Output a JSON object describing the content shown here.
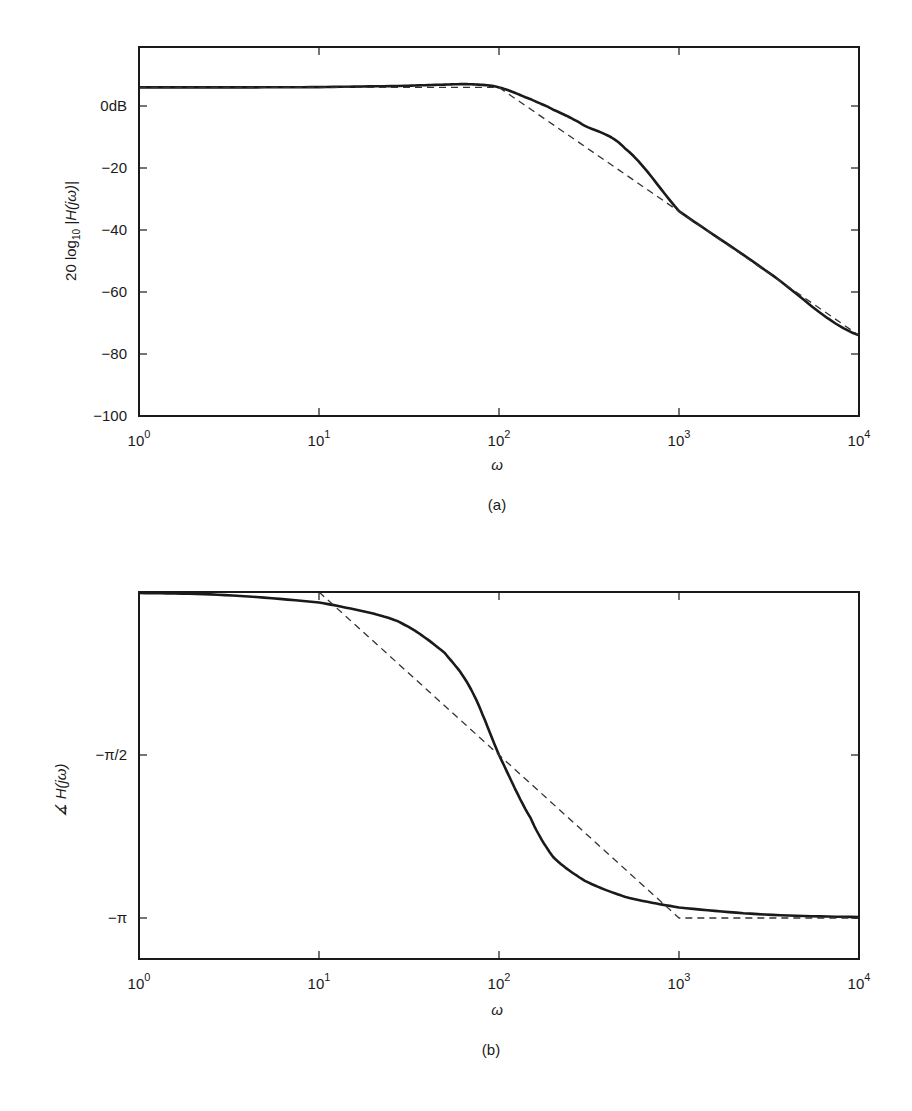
{
  "figure": {
    "panels": [
      {
        "caption": "(a)",
        "xlabel": "ω",
        "ylabel_prefix": "20 log",
        "ylabel_sub": "10",
        "ylabel_suffix": " |H(jω)|",
        "xticks": [
          {
            "base": "10",
            "exp": "0"
          },
          {
            "base": "10",
            "exp": "1"
          },
          {
            "base": "10",
            "exp": "2"
          },
          {
            "base": "10",
            "exp": "3"
          },
          {
            "base": "10",
            "exp": "4"
          }
        ],
        "yticks": [
          "0dB",
          "−20",
          "−40",
          "−60",
          "−80",
          "−100"
        ]
      },
      {
        "caption": "(b)",
        "xlabel": "ω",
        "ylabel": "∡ H(jω)",
        "xticks": [
          {
            "base": "10",
            "exp": "0"
          },
          {
            "base": "10",
            "exp": "1"
          },
          {
            "base": "10",
            "exp": "2"
          },
          {
            "base": "10",
            "exp": "3"
          },
          {
            "base": "10",
            "exp": "4"
          }
        ],
        "yticks": [
          "−π/2",
          "−π"
        ]
      }
    ]
  },
  "chart_data": [
    {
      "type": "line",
      "title": "(a)",
      "xlabel": "ω",
      "ylabel": "20 log10 |H(jω)|",
      "xscale": "log",
      "xlim": [
        1,
        10000
      ],
      "ylim": [
        -100,
        19
      ],
      "xtick_labels": [
        "10^0",
        "10^1",
        "10^2",
        "10^3",
        "10^4"
      ],
      "ytick_labels": [
        "0dB",
        "-20",
        "-40",
        "-60",
        "-80",
        "-100"
      ],
      "ytick_values": [
        0,
        -20,
        -40,
        -60,
        -80,
        -100
      ],
      "grid": false,
      "series": [
        {
          "name": "exact magnitude",
          "style": "solid",
          "x": [
            1,
            3,
            10,
            30,
            50,
            70,
            100,
            150,
            200,
            300,
            500,
            1000,
            3000,
            10000
          ],
          "y": [
            6.0,
            6.0,
            6.1,
            6.5,
            6.9,
            7.0,
            6.0,
            2.2,
            -1.2,
            -6.4,
            -13.6,
            -33.9,
            -52.9,
            -74.0
          ]
        },
        {
          "name": "asymptotic approximation",
          "style": "dashed",
          "x": [
            1,
            100,
            10000
          ],
          "y": [
            6.0,
            6.0,
            -74.0
          ]
        }
      ]
    },
    {
      "type": "line",
      "title": "(b)",
      "xlabel": "ω",
      "ylabel": "∡ H(jω)",
      "xscale": "log",
      "xlim": [
        1,
        10000
      ],
      "ylim": [
        -3.6,
        0
      ],
      "xtick_labels": [
        "10^0",
        "10^1",
        "10^2",
        "10^3",
        "10^4"
      ],
      "ytick_labels": [
        "-π/2",
        "-π"
      ],
      "ytick_values": [
        -1.5708,
        -3.1416
      ],
      "grid": false,
      "series": [
        {
          "name": "exact phase",
          "style": "solid",
          "x": [
            1,
            3,
            10,
            20,
            30,
            50,
            70,
            100,
            150,
            200,
            300,
            500,
            1000,
            3000,
            10000
          ],
          "y": [
            -0.01,
            -0.03,
            -0.101,
            -0.206,
            -0.318,
            -0.588,
            -0.94,
            -1.571,
            -2.18,
            -2.554,
            -2.783,
            -2.937,
            -3.04,
            -3.108,
            -3.132
          ]
        },
        {
          "name": "asymptotic approximation",
          "style": "dashed",
          "x": [
            1,
            10,
            1000,
            10000
          ],
          "y": [
            0,
            0,
            -3.1416,
            -3.1416
          ]
        }
      ]
    }
  ]
}
